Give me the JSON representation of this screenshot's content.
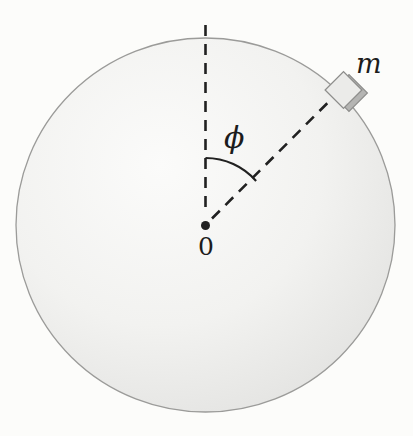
{
  "figure": {
    "labels": {
      "mass": "m",
      "angle": "ϕ",
      "center": "0"
    },
    "colors": {
      "background": "#fcfcfa",
      "sphere_highlight": "#fbfbfa",
      "sphere_mid": "#f2f2f0",
      "sphere_edge": "#e1e1df",
      "sphere_outline": "#9b9b99",
      "line": "#212121",
      "block_face": "#ebebe9",
      "block_depth": "#b5b5b3",
      "block_outline": "#8e8e8c",
      "text": "#1c1c1c"
    }
  }
}
